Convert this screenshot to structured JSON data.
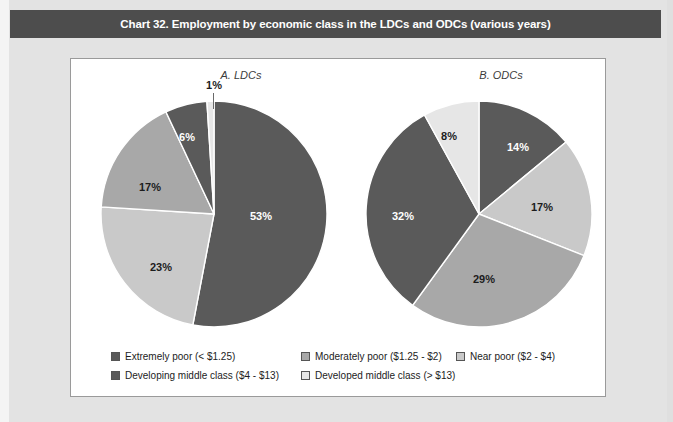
{
  "header": {
    "title": "Chart 32. Employment by economic class in the LDCs and ODCs (various years)",
    "bar_color": "#4d4d4d",
    "text_color": "#ffffff"
  },
  "palette": {
    "extremely_poor": "#5a5a5a",
    "moderately_poor": "#a8a8a8",
    "near_poor": "#c9c9c9",
    "developing_middle_class": "#5a5a5a",
    "developed_middle_class": "#e6e6e6",
    "outline": "#555555",
    "panel_background": "#ffffff",
    "page_background": "#e3e3e3"
  },
  "legend": {
    "items": [
      {
        "label": "Extremely poor (< $1.25)",
        "color": "#5a5a5a"
      },
      {
        "label": "Moderately poor ($1.25 - $2)",
        "color": "#a8a8a8"
      },
      {
        "label": "Near poor ($2 - $4)",
        "color": "#c9c9c9"
      },
      {
        "label": "Developing middle class ($4 - $13)",
        "color": "#5a5a5a"
      },
      {
        "label": "Developed middle class (> $13)",
        "color": "#e6e6e6"
      }
    ]
  },
  "chart_data": [
    {
      "type": "pie",
      "title": "A. LDCs",
      "labels": [
        "Extremely poor (< $1.25)",
        "Moderately poor ($1.25 - $2)",
        "Near poor ($2 - $4)",
        "Developing middle class ($4 - $13)",
        "Developed middle class (> $13)"
      ],
      "values": [
        53,
        23,
        17,
        6,
        1
      ],
      "value_labels": [
        "53%",
        "23%",
        "17%",
        "6%",
        "1%"
      ],
      "colors": [
        "#5a5a5a",
        "#c9c9c9",
        "#a8a8a8",
        "#5a5a5a",
        "#e6e6e6"
      ],
      "start_angle": 0,
      "direction": "clockwise",
      "legend_position": "bottom"
    },
    {
      "type": "pie",
      "title": "B. ODCs",
      "labels": [
        "Extremely poor (< $1.25)",
        "Moderately poor ($1.25 - $2)",
        "Near poor ($2 - $4)",
        "Developing middle class ($4 - $13)",
        "Developed middle class (> $13)"
      ],
      "values": [
        14,
        17,
        29,
        32,
        8
      ],
      "value_labels": [
        "14%",
        "17%",
        "29%",
        "32%",
        "8%"
      ],
      "colors": [
        "#5a5a5a",
        "#c9c9c9",
        "#a8a8a8",
        "#5a5a5a",
        "#e6e6e6"
      ],
      "start_angle": 0,
      "direction": "clockwise",
      "legend_position": "bottom"
    }
  ]
}
